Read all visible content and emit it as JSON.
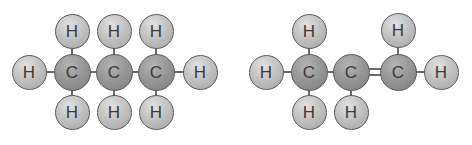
{
  "diagram": {
    "type": "molecular-structure",
    "colors": {
      "hydrogen": "#c2c2c2",
      "carbon": "#959595",
      "bond": "#6a6a6a",
      "label": "#3a3a3a"
    },
    "molecules": [
      {
        "name": "left-molecule",
        "formula_shown": "C3H8",
        "atoms": [
          {
            "id": "a1",
            "el": "H",
            "label": "H",
            "x": 29,
            "y": 72
          },
          {
            "id": "a2",
            "el": "C",
            "label": "C",
            "x": 72,
            "y": 72
          },
          {
            "id": "a3",
            "el": "C",
            "label": "C",
            "x": 114,
            "y": 72
          },
          {
            "id": "a4",
            "el": "C",
            "label": "C",
            "x": 156,
            "y": 72
          },
          {
            "id": "a5",
            "el": "H",
            "label": "H",
            "x": 200,
            "y": 72
          },
          {
            "id": "a6",
            "el": "H",
            "label": "H",
            "x": 72,
            "y": 31
          },
          {
            "id": "a7",
            "el": "H",
            "label": "H",
            "x": 114,
            "y": 31
          },
          {
            "id": "a8",
            "el": "H",
            "label": "H",
            "x": 156,
            "y": 31
          },
          {
            "id": "a9",
            "el": "H",
            "label": "H",
            "x": 72,
            "y": 112
          },
          {
            "id": "a10",
            "el": "H",
            "label": "H",
            "x": 114,
            "y": 112
          },
          {
            "id": "a11",
            "el": "H",
            "label": "H",
            "x": 156,
            "y": 112
          }
        ],
        "bonds": [
          {
            "from": "a1",
            "to": "a2",
            "order": 1
          },
          {
            "from": "a2",
            "to": "a3",
            "order": 1
          },
          {
            "from": "a3",
            "to": "a4",
            "order": 1
          },
          {
            "from": "a4",
            "to": "a5",
            "order": 1
          },
          {
            "from": "a2",
            "to": "a6",
            "order": 1
          },
          {
            "from": "a3",
            "to": "a7",
            "order": 1
          },
          {
            "from": "a4",
            "to": "a8",
            "order": 1
          },
          {
            "from": "a2",
            "to": "a9",
            "order": 1
          },
          {
            "from": "a3",
            "to": "a10",
            "order": 1
          },
          {
            "from": "a4",
            "to": "a11",
            "order": 1
          }
        ]
      },
      {
        "name": "right-molecule",
        "formula_shown": "C3H6",
        "atoms": [
          {
            "id": "b1",
            "el": "H",
            "label": "H",
            "x": 266,
            "y": 72
          },
          {
            "id": "b2",
            "el": "C",
            "label": "C",
            "x": 309,
            "y": 72
          },
          {
            "id": "b3",
            "el": "C",
            "label": "C",
            "x": 351,
            "y": 72
          },
          {
            "id": "b4",
            "el": "C",
            "label": "C",
            "x": 398,
            "y": 72
          },
          {
            "id": "b5",
            "el": "H",
            "label": "H",
            "x": 441,
            "y": 72
          },
          {
            "id": "b6",
            "el": "H",
            "label": "H",
            "x": 309,
            "y": 31
          },
          {
            "id": "b7",
            "el": "H",
            "label": "H",
            "x": 398,
            "y": 30
          },
          {
            "id": "b8",
            "el": "H",
            "label": "H",
            "x": 309,
            "y": 112
          },
          {
            "id": "b9",
            "el": "H",
            "label": "H",
            "x": 351,
            "y": 112
          }
        ],
        "bonds": [
          {
            "from": "b1",
            "to": "b2",
            "order": 1
          },
          {
            "from": "b2",
            "to": "b3",
            "order": 1
          },
          {
            "from": "b3",
            "to": "b4",
            "order": 2
          },
          {
            "from": "b4",
            "to": "b5",
            "order": 1
          },
          {
            "from": "b2",
            "to": "b6",
            "order": 1
          },
          {
            "from": "b4",
            "to": "b7",
            "order": 1
          },
          {
            "from": "b2",
            "to": "b8",
            "order": 1
          },
          {
            "from": "b3",
            "to": "b9",
            "order": 1
          }
        ]
      }
    ]
  }
}
